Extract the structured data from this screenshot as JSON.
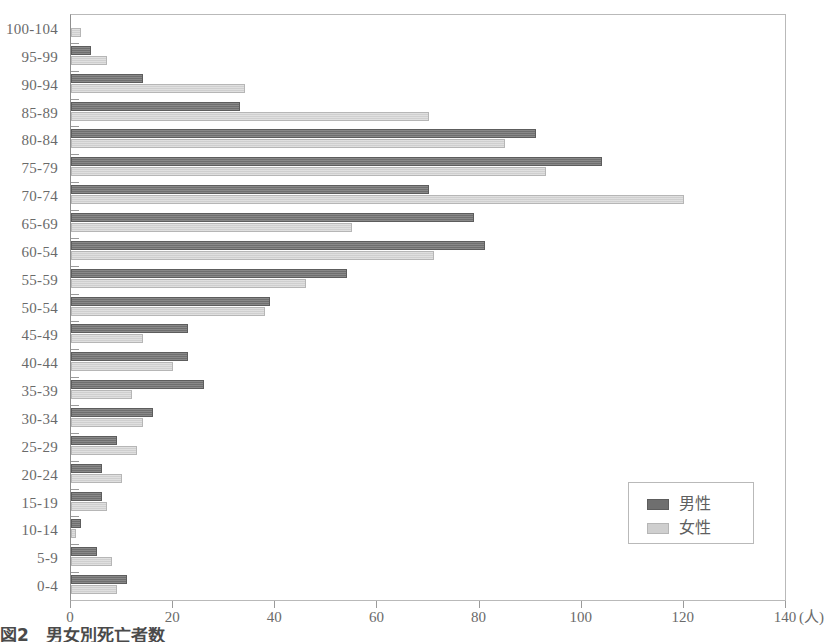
{
  "caption": "図2　男女別死亡者数",
  "legend": {
    "position": "bottom-right",
    "items": [
      {
        "name": "male-legend",
        "label": "男性",
        "color": "#6f6f6f"
      },
      {
        "name": "female-legend",
        "label": "女性",
        "color": "#cfcfcf"
      }
    ]
  },
  "axis": {
    "x_unit": "(人)",
    "x_ticks": [
      "0",
      "20",
      "40",
      "60",
      "80",
      "100",
      "120",
      "140"
    ]
  },
  "chart_data": {
    "type": "bar",
    "orientation": "horizontal",
    "title": "図2　男女別死亡者数",
    "xlabel": "(人)",
    "ylabel": "",
    "xlim": [
      0,
      140
    ],
    "ylim": null,
    "grid": false,
    "legend_position": "bottom-right",
    "categories": [
      "100-104",
      "95-99",
      "90-94",
      "85-89",
      "80-84",
      "75-79",
      "70-74",
      "65-69",
      "60-54",
      "55-59",
      "50-54",
      "45-49",
      "40-44",
      "35-39",
      "30-34",
      "25-29",
      "20-24",
      "15-19",
      "10-14",
      "5-9",
      "0-4"
    ],
    "series": [
      {
        "name": "男性",
        "color": "#6f6f6f",
        "values": [
          0,
          4,
          14,
          33,
          91,
          104,
          70,
          79,
          81,
          54,
          39,
          23,
          23,
          26,
          16,
          9,
          6,
          6,
          2,
          5,
          11
        ]
      },
      {
        "name": "女性",
        "color": "#cfcfcf",
        "values": [
          2,
          7,
          34,
          70,
          85,
          93,
          120,
          55,
          71,
          46,
          38,
          14,
          20,
          12,
          14,
          13,
          10,
          7,
          1,
          8,
          9
        ]
      }
    ]
  }
}
